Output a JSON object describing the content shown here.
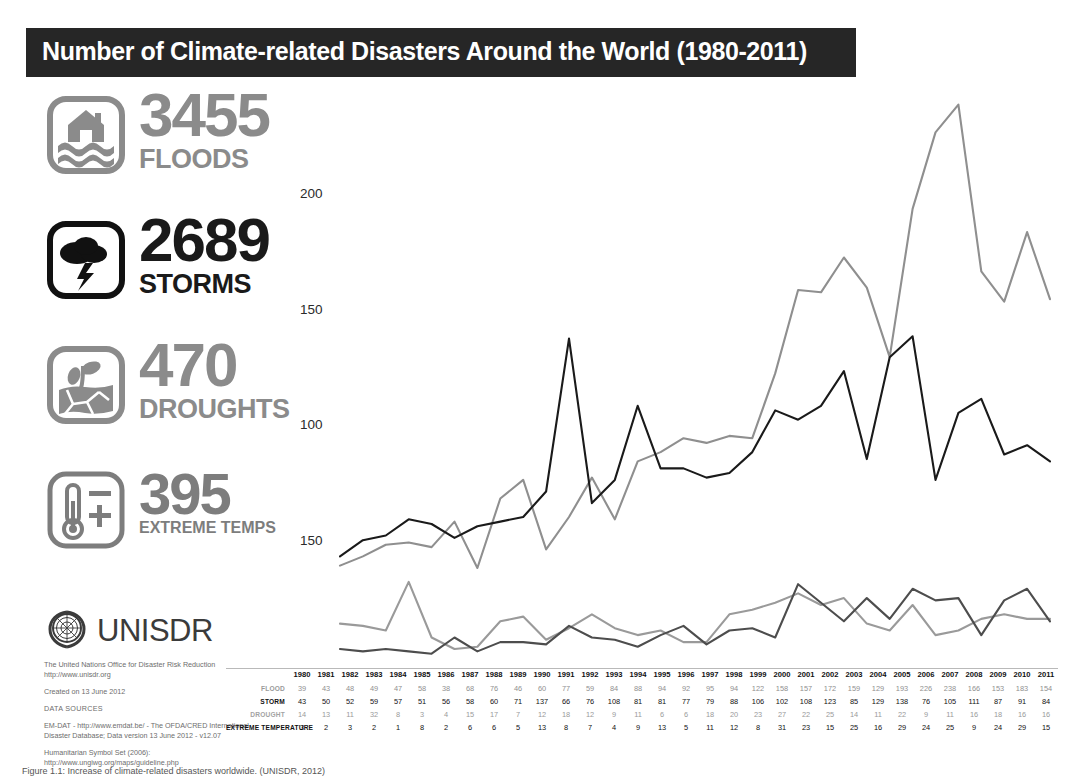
{
  "header": {
    "title": "Number of Climate-related Disasters Around the World (1980-2011)"
  },
  "stats": [
    {
      "icon": "flood-icon",
      "value": "3455",
      "label": "FLOODS",
      "color": "#8b8b8b"
    },
    {
      "icon": "storm-icon",
      "value": "2689",
      "label": "STORMS",
      "color": "#1a1a1a"
    },
    {
      "icon": "drought-icon",
      "value": "470",
      "label": "DROUGHTS",
      "color": "#8b8b8b"
    },
    {
      "icon": "thermometer-icon",
      "value": "395",
      "label": "EXTREME TEMPS",
      "color": "#7d7d7d"
    }
  ],
  "branding": {
    "logo": "un-emblem-icon",
    "name": "UNISDR",
    "line1": "The United Nations Office for Disaster Risk Reduction",
    "line2": "http://www.unisdr.org",
    "created": "Created on 13 June 2012",
    "sources_header": "DATA SOURCES",
    "source1": "EM-DAT - http://www.emdat.be/ - The OFDA/CRED International",
    "source2": "Disaster Database; Data version 13 June 2012 - v12.07",
    "symbols1": "Humanitarian Symbol Set (2006):",
    "symbols2": "http://www.ungiwg.org/maps/guideline.php"
  },
  "caption": "Figure 1.1: Increase of climate-related disasters worldwide. (UNISDR, 2012)",
  "chart_data": {
    "type": "line",
    "title": "Number of Climate-related Disasters Around the World (1980-2011)",
    "xlabel": "",
    "ylabel": "",
    "grid": false,
    "legend": "none",
    "ylim": [
      0,
      240
    ],
    "yticks": [
      200,
      150,
      100,
      150
    ],
    "ytick_values": [
      200,
      150,
      100,
      50
    ],
    "categories": [
      "1980",
      "1981",
      "1982",
      "1983",
      "1984",
      "1985",
      "1986",
      "1987",
      "1988",
      "1989",
      "1990",
      "1991",
      "1992",
      "1993",
      "1994",
      "1995",
      "1996",
      "1997",
      "1998",
      "1999",
      "2000",
      "2001",
      "2002",
      "2003",
      "2004",
      "2005",
      "2006",
      "2007",
      "2008",
      "2009",
      "2010",
      "2011"
    ],
    "series": [
      {
        "name": "FLOOD",
        "color": "#8f8f8f",
        "values": [
          39,
          43,
          48,
          49,
          47,
          58,
          38,
          68,
          76,
          46,
          60,
          77,
          59,
          84,
          88,
          94,
          92,
          95,
          94,
          122,
          158,
          157,
          172,
          159,
          129,
          193,
          226,
          238,
          166,
          153,
          183,
          154
        ]
      },
      {
        "name": "STORM",
        "color": "#1a1a1a",
        "values": [
          43,
          50,
          52,
          59,
          57,
          51,
          56,
          58,
          60,
          71,
          137,
          66,
          76,
          108,
          81,
          81,
          77,
          79,
          88,
          106,
          102,
          108,
          123,
          85,
          129,
          138,
          76,
          105,
          111,
          87,
          91,
          84
        ]
      },
      {
        "name": "DROUGHT",
        "color": "#9a9a9a",
        "values": [
          14,
          13,
          11,
          32,
          8,
          3,
          4,
          15,
          17,
          7,
          12,
          18,
          12,
          9,
          11,
          6,
          6,
          18,
          20,
          23,
          27,
          22,
          25,
          14,
          11,
          22,
          9,
          11,
          16,
          18,
          16,
          16
        ]
      },
      {
        "name": "EXTREME TEMPERATURE",
        "color": "#4d4d4d",
        "values": [
          3,
          2,
          3,
          2,
          1,
          8,
          2,
          6,
          6,
          5,
          13,
          8,
          7,
          4,
          9,
          13,
          5,
          11,
          12,
          8,
          31,
          23,
          15,
          25,
          16,
          29,
          24,
          25,
          9,
          24,
          29,
          15
        ]
      }
    ]
  },
  "table": {
    "years": [
      "1980",
      "1981",
      "1982",
      "1983",
      "1984",
      "1985",
      "1986",
      "1987",
      "1988",
      "1989",
      "1990",
      "1991",
      "1992",
      "1993",
      "1994",
      "1995",
      "1996",
      "1997",
      "1998",
      "1999",
      "2000",
      "2001",
      "2002",
      "2003",
      "2004",
      "2005",
      "2006",
      "2007",
      "2008",
      "2009",
      "2010",
      "2011"
    ],
    "rows": [
      {
        "label": "FLOOD",
        "values": [
          "39",
          "43",
          "48",
          "49",
          "47",
          "58",
          "38",
          "68",
          "76",
          "46",
          "60",
          "77",
          "59",
          "84",
          "88",
          "94",
          "92",
          "95",
          "94",
          "122",
          "158",
          "157",
          "172",
          "159",
          "129",
          "193",
          "226",
          "238",
          "166",
          "153",
          "183",
          "154"
        ]
      },
      {
        "label": "STORM",
        "values": [
          "43",
          "50",
          "52",
          "59",
          "57",
          "51",
          "56",
          "58",
          "60",
          "71",
          "137",
          "66",
          "76",
          "108",
          "81",
          "81",
          "77",
          "79",
          "88",
          "106",
          "102",
          "108",
          "123",
          "85",
          "129",
          "138",
          "76",
          "105",
          "111",
          "87",
          "91",
          "84"
        ]
      },
      {
        "label": "DROUGHT",
        "values": [
          "14",
          "13",
          "11",
          "32",
          "8",
          "3",
          "4",
          "15",
          "17",
          "7",
          "12",
          "18",
          "12",
          "9",
          "11",
          "6",
          "6",
          "18",
          "20",
          "23",
          "27",
          "22",
          "25",
          "14",
          "11",
          "22",
          "9",
          "11",
          "16",
          "18",
          "16",
          "16"
        ]
      },
      {
        "label": "EXTREME TEMPERATURE",
        "values": [
          "3",
          "2",
          "3",
          "2",
          "1",
          "8",
          "2",
          "6",
          "6",
          "5",
          "13",
          "8",
          "7",
          "4",
          "9",
          "13",
          "5",
          "11",
          "12",
          "8",
          "31",
          "23",
          "15",
          "25",
          "16",
          "29",
          "24",
          "25",
          "9",
          "24",
          "29",
          "15"
        ]
      }
    ]
  }
}
